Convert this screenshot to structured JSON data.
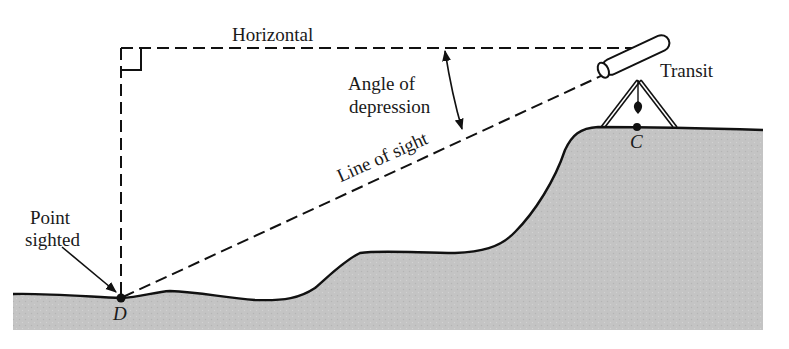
{
  "diagram": {
    "type": "surveying angle of depression illustration",
    "labels": {
      "horizontal": "Horizontal",
      "angle_line1": "Angle of",
      "angle_line2": "depression",
      "transit": "Transit",
      "line_of_sight": "Line of sight",
      "point_sighted_line1": "Point",
      "point_sighted_line2": "sighted",
      "point_c": "C",
      "point_d": "D"
    },
    "colors": {
      "ground_fill": "#c4c4c4",
      "ink": "#111111",
      "background": "#ffffff"
    }
  }
}
